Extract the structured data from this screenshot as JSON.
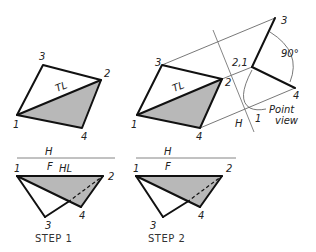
{
  "figure": {
    "colors": {
      "line": "#111111",
      "shade": "#b8b8b8",
      "projection": "#555555",
      "fold": "#777777",
      "background": "#ffffff"
    }
  },
  "step1": {
    "caption": "STEP 1",
    "top_view": {
      "labels": {
        "v1": "1",
        "v2": "2",
        "v3": "3",
        "v4": "4",
        "tl": "TL"
      }
    },
    "fold_line": {
      "upper": "H",
      "lower": "F"
    },
    "front_view": {
      "labels": {
        "v1": "1",
        "v2": "2",
        "v3": "3",
        "v4": "4",
        "hl": "HL"
      }
    }
  },
  "step2": {
    "caption": "STEP 2",
    "top_view": {
      "labels": {
        "v1": "1",
        "v2": "2",
        "v3": "3",
        "v4": "4",
        "tl": "TL"
      }
    },
    "fold_line": {
      "upper": "H",
      "lower": "F"
    },
    "aux_fold_line": {
      "side_a": "H",
      "side_b": "1"
    },
    "aux_view": {
      "labels": {
        "v21": "2,1",
        "v3": "3",
        "v4": "4"
      },
      "angle_label": "90°",
      "annotation_line1": "Point",
      "annotation_line2": "view"
    },
    "front_view": {
      "labels": {
        "v1": "1",
        "v2": "2",
        "v3": "3",
        "v4": "4"
      }
    }
  }
}
